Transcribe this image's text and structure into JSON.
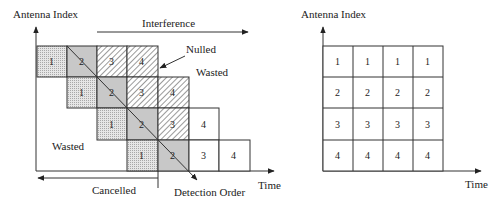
{
  "left_diagram": {
    "y_axis_label": "Antenna Index",
    "x_axis_label": "Time",
    "annotations": {
      "interference": "Interference",
      "nulled": "Nulled",
      "wasted_top": "Wasted",
      "wasted_left": "Wasted",
      "cancelled": "Cancelled",
      "detection_order": "Detection Order"
    },
    "rows": [
      {
        "cells": [
          {
            "label": "1",
            "fill": "dotted"
          },
          {
            "label": "2",
            "fill": "gray"
          },
          {
            "label": "3",
            "fill": "hatched"
          },
          {
            "label": "4",
            "fill": "hatched"
          }
        ]
      },
      {
        "cells": [
          {
            "label": "1",
            "fill": "dotted"
          },
          {
            "label": "2",
            "fill": "gray"
          },
          {
            "label": "3",
            "fill": "hatched"
          },
          {
            "label": "4",
            "fill": "hatched"
          }
        ]
      },
      {
        "cells": [
          {
            "label": "1",
            "fill": "dotted"
          },
          {
            "label": "2",
            "fill": "gray"
          },
          {
            "label": "3",
            "fill": "hatched"
          },
          {
            "label": "4",
            "fill": "white"
          }
        ]
      },
      {
        "cells": [
          {
            "label": "1",
            "fill": "dotted"
          },
          {
            "label": "2",
            "fill": "gray"
          },
          {
            "label": "3",
            "fill": "white"
          },
          {
            "label": "4",
            "fill": "white"
          }
        ]
      }
    ]
  },
  "right_diagram": {
    "y_axis_label": "Antenna Index",
    "x_axis_label": "Time",
    "rows": [
      {
        "cells": [
          "1",
          "1",
          "1",
          "1"
        ]
      },
      {
        "cells": [
          "2",
          "2",
          "2",
          "2"
        ]
      },
      {
        "cells": [
          "3",
          "3",
          "3",
          "3"
        ]
      },
      {
        "cells": [
          "4",
          "4",
          "4",
          "4"
        ]
      }
    ]
  },
  "colors": {
    "gray_fill": "#c8c8c8",
    "dotted_fill": "#dcdcdc",
    "stroke": "#333333"
  }
}
